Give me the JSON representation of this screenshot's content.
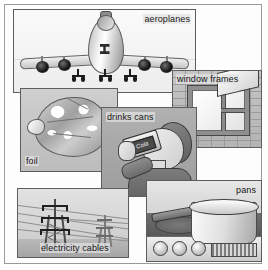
{
  "collage": {
    "title": "Uses of aluminium collage",
    "style": "grayscale overlapping photo panels",
    "panels": [
      {
        "id": "aeroplanes",
        "label": "aeroplanes",
        "subject": "front view of a four-engine jumbo jet airliner in flight",
        "label_position": "top-right"
      },
      {
        "id": "window-frames",
        "label": "window frames",
        "subject": "metal-framed window set in a brick wall with the top pane propped open",
        "label_position": "top-left"
      },
      {
        "id": "foil",
        "label": "foil",
        "subject": "food parcel wrapped in crumpled shiny aluminium foil",
        "label_position": "bottom-left"
      },
      {
        "id": "drinks-cans",
        "label": "drinks cans",
        "subject": "boy drinking from an aluminium cola can",
        "label_position": "top-left",
        "can_label": "Cola"
      },
      {
        "id": "electricity-cables",
        "label": "electricity cables",
        "subject": "two electricity pylons carrying overhead power cables",
        "label_position": "bottom-centre"
      },
      {
        "id": "pans",
        "label": "pans",
        "subject": "aluminium saucepan standing on an electric cooker hob",
        "label_position": "top-right"
      }
    ]
  }
}
